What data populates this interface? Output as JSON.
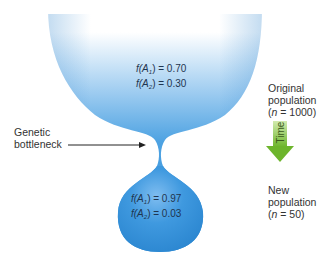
{
  "diagram": {
    "type": "genetic-bottleneck",
    "colors": {
      "population_blue": "#3d97de",
      "population_blue_dark": "#2a82cc",
      "fade_top": "#ffffff",
      "arrow_green": "#7cbf3a",
      "arrow_green_light": "#b8dd88",
      "text": "#333333",
      "freq_text": "#1f3550"
    },
    "original_population": {
      "freq_A1": {
        "label_f": "f(A",
        "sub": "1",
        "close": ") = 0.70"
      },
      "freq_A2": {
        "label_f": "f(A",
        "sub": "2",
        "close": ") = 0.30"
      },
      "title_line1": "Original",
      "title_line2": "population",
      "size_open": "(",
      "size_n": "n",
      "size_rest": " = 1000)"
    },
    "bottleneck_label": {
      "line1": "Genetic",
      "line2": "bottleneck"
    },
    "time_arrow": {
      "label": "Time"
    },
    "new_population": {
      "freq_A1": {
        "label_f": "f(A",
        "sub": "1",
        "close": ") = 0.97"
      },
      "freq_A2": {
        "label_f": "f(A",
        "sub": "2",
        "close": ") = 0.03"
      },
      "title_line1": "New",
      "title_line2": "population",
      "size_open": "(",
      "size_n": "n",
      "size_rest": " = 50)"
    }
  }
}
